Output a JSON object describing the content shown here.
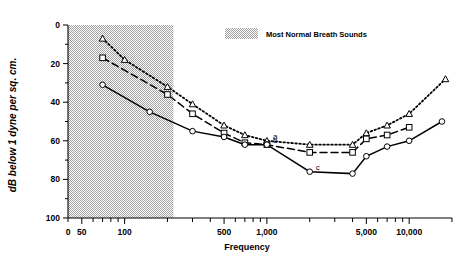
{
  "chart_data": {
    "type": "line",
    "title": "",
    "xlabel": "Frequency",
    "ylabel": "dB below 1 dyne per sq. cm.",
    "xscale": "log",
    "xlim": [
      40,
      20000
    ],
    "ylim": [
      0,
      100
    ],
    "y_inverted": true,
    "grid": false,
    "xticks_major": [
      50,
      100,
      500,
      1000,
      5000,
      10000
    ],
    "xticklabels": [
      "50",
      "100",
      "500",
      "1,000",
      "5,000",
      "10,000"
    ],
    "x_origin_label": "0",
    "yticks_major": [
      0,
      20,
      40,
      60,
      80,
      100
    ],
    "yticklabels": [
      "0",
      "20",
      "40",
      "60",
      "80",
      "100"
    ],
    "yticks_minor": [
      10,
      30,
      50,
      70,
      90
    ],
    "legend": {
      "position": "top-right",
      "entries": [
        {
          "label": "Most Normal Breath Sounds",
          "swatch": "hatched-gray",
          "color": "#a8a8a8"
        }
      ]
    },
    "shaded_band": {
      "label": "Most Normal Breath Sounds",
      "x_from": 40,
      "x_to": 220,
      "color": "#b0b0b0"
    },
    "series": [
      {
        "name": "a",
        "annotation": "a",
        "marker": "triangle",
        "linestyle": "dotted",
        "x": [
          70,
          100,
          200,
          300,
          500,
          700,
          1000,
          2000,
          4000,
          5000,
          7000,
          10000,
          18000
        ],
        "y": [
          7,
          18,
          32,
          41,
          52,
          57,
          60,
          62,
          62,
          56,
          52,
          46,
          28
        ]
      },
      {
        "name": "b",
        "annotation": "b",
        "marker": "square",
        "linestyle": "dashed",
        "x": [
          70,
          200,
          300,
          500,
          700,
          1000,
          2000,
          4000,
          5000,
          7000,
          10000
        ],
        "y": [
          17,
          36,
          46,
          56,
          61,
          62,
          66,
          66,
          59,
          57,
          53
        ]
      },
      {
        "name": "c",
        "annotation": "c",
        "marker": "circle",
        "linestyle": "solid",
        "x": [
          70,
          150,
          300,
          500,
          700,
          1000,
          2000,
          4000,
          5000,
          7000,
          10000,
          17000
        ],
        "y": [
          31,
          45,
          55,
          58,
          62,
          62,
          76,
          77,
          68,
          63,
          60,
          50
        ]
      }
    ]
  }
}
